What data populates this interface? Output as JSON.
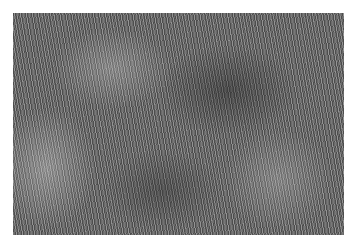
{
  "image": {
    "subject": "grayscale grass texture",
    "alt": "Grayscale close-up texture of dense grass blades"
  }
}
